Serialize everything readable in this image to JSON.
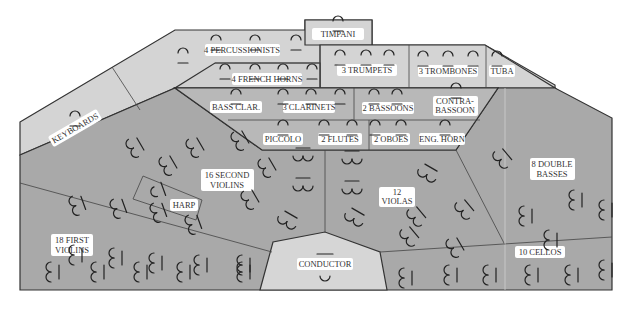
{
  "colors": {
    "light": "#d4d4d4",
    "medium": "#b4b4b4",
    "dark": "#a8a8a8",
    "label_bg": "#ffffff",
    "outline": "#333333"
  },
  "sections": {
    "timpani": "TIMPANI",
    "percussion": "4 PERCUSSIONISTS",
    "french_horns": "4 FRENCH HORNS",
    "trumpets": "3 TRUMPETS",
    "trombones": "3 TROMBONES",
    "tuba": "TUBA",
    "keyboards": "KEYBOARDS",
    "bass_clarinet": "BASS CLAR.",
    "clarinets": "3 CLARINETS",
    "bassoons": "2 BASSOONS",
    "contrabassoon_1": "CONTRA-",
    "contrabassoon_2": "BASSOON",
    "piccolo": "PICCOLO",
    "flutes": "2 FLUTES",
    "oboes": "2 OBOES",
    "english_horn": "ENG. HORN",
    "second_violins_1": "16 SECOND",
    "second_violins_2": "VIOLINS",
    "harp": "HARP",
    "first_violins_1": "18 FIRST",
    "first_violins_2": "VIOLINS",
    "violas_1": "12",
    "violas_2": "VIOLAS",
    "double_basses_1": "8 DOUBLE",
    "double_basses_2": "BASSES",
    "cellos": "10 CELLOS",
    "conductor": "CONDUCTOR"
  }
}
